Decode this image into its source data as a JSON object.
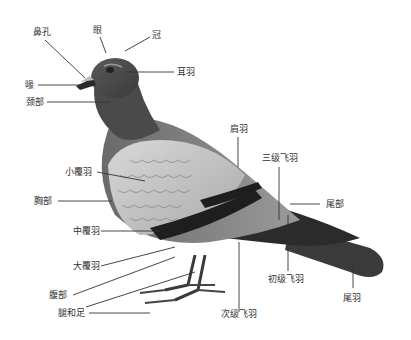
{
  "diagram": {
    "labels": {
      "nostril": "鼻孔",
      "eye": "眼",
      "crown": "冠",
      "ear_coverts": "耳羽",
      "beak": "喙",
      "neck": "颈部",
      "scapulars": "肩羽",
      "tertials": "三级飞羽",
      "lesser_coverts": "小覆羽",
      "breast": "胸部",
      "rump": "尾部",
      "median_coverts": "中覆羽",
      "greater_coverts": "大覆羽",
      "primaries": "初级飞羽",
      "belly": "腹部",
      "legs_and_feet": "腿和足",
      "secondaries": "次级飞羽",
      "tail_feathers": "尾羽"
    }
  }
}
